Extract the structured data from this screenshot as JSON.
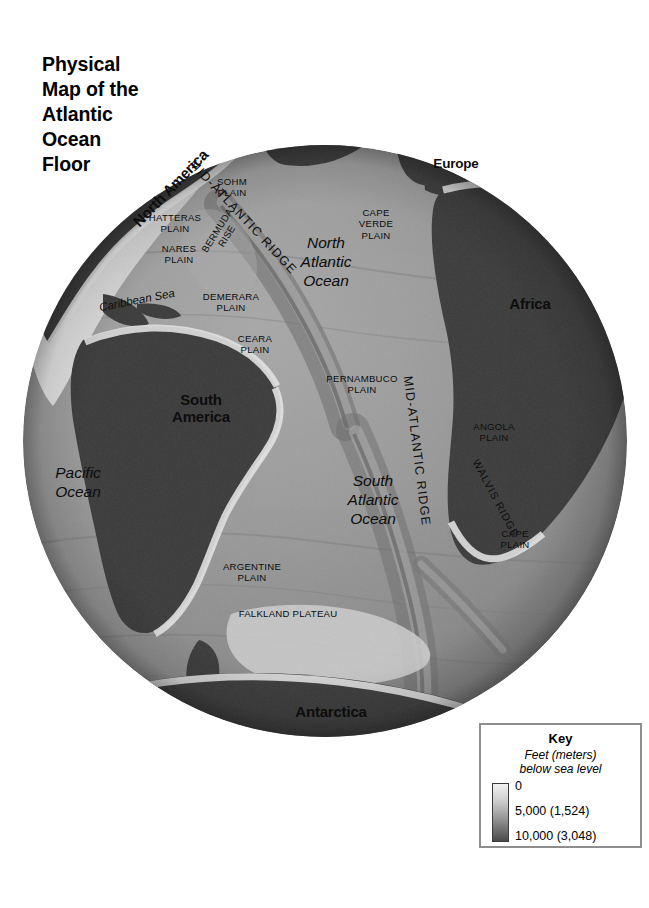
{
  "title": "Physical\nMap of the\nAtlantic\nOcean\nFloor",
  "map": {
    "continents": [
      {
        "name": "north-america",
        "label": "North America"
      },
      {
        "name": "europe",
        "label": "Europe"
      },
      {
        "name": "africa",
        "label": "Africa"
      },
      {
        "name": "south-america",
        "label": "South\nAmerica"
      },
      {
        "name": "antarctica",
        "label": "Antarctica"
      }
    ],
    "oceans": [
      {
        "name": "north-atlantic-ocean",
        "label": "North\nAtlantic\nOcean"
      },
      {
        "name": "south-atlantic-ocean",
        "label": "South\nAtlantic\nOcean"
      },
      {
        "name": "pacific-ocean",
        "label": "Pacific\nOcean"
      },
      {
        "name": "caribbean-sea",
        "label": "Caribbean Sea"
      }
    ],
    "ridges": [
      {
        "name": "mid-atlantic-ridge-north",
        "label": "MID-ATLANTIC RIDGE"
      },
      {
        "name": "mid-atlantic-ridge-south",
        "label": "MID-ATLANTIC RIDGE"
      },
      {
        "name": "walvis-ridge",
        "label": "WALVIS RIDGE"
      },
      {
        "name": "bermuda-rise",
        "label": "BERMUDA\nRISE"
      }
    ],
    "plains": [
      {
        "name": "sohm-plain",
        "label": "SOHM\nPLAIN"
      },
      {
        "name": "hatteras-plain",
        "label": "HATTERAS\nPLAIN"
      },
      {
        "name": "nares-plain",
        "label": "NARES\nPLAIN"
      },
      {
        "name": "demerara-plain",
        "label": "DEMERARA\nPLAIN"
      },
      {
        "name": "ceara-plain",
        "label": "CEARA\nPLAIN"
      },
      {
        "name": "cape-verde-plain",
        "label": "CAPE\nVERDE\nPLAIN"
      },
      {
        "name": "pernambuco-plain",
        "label": "PERNAMBUCO\nPLAIN"
      },
      {
        "name": "angola-plain",
        "label": "ANGOLA\nPLAIN"
      },
      {
        "name": "cape-plain",
        "label": "CAPE\nPLAIN"
      },
      {
        "name": "argentine-plain",
        "label": "ARGENTINE\nPLAIN"
      },
      {
        "name": "falkland-plateau",
        "label": "FALKLAND PLATEAU"
      }
    ]
  },
  "key": {
    "title": "Key",
    "subtitle": "Feet (meters)\nbelow sea level",
    "ticks": [
      {
        "label": "0",
        "depth_ft": 0,
        "depth_m": 0
      },
      {
        "label": "5,000 (1,524)",
        "depth_ft": 5000,
        "depth_m": 1524
      },
      {
        "label": "10,000 (3,048)",
        "depth_ft": 10000,
        "depth_m": 3048
      }
    ],
    "gradient": {
      "shallow_color": "#f2f2f2",
      "deep_color": "#4a4a4a"
    }
  },
  "colors": {
    "continent": "#3a3a3a",
    "shelf": "#e8e8e8",
    "ocean_mid": "#9a9a9a",
    "ocean_deep": "#6e6e6e",
    "background": "#ffffff"
  }
}
